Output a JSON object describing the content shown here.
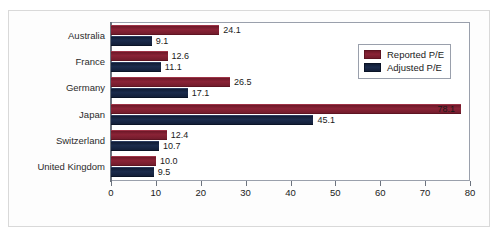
{
  "chart_data": {
    "type": "bar",
    "orientation": "horizontal",
    "title": "",
    "xlabel": "",
    "ylabel": "",
    "xlim": [
      0,
      80
    ],
    "xticks": [
      0,
      10,
      20,
      30,
      40,
      50,
      60,
      70,
      80
    ],
    "grid": false,
    "legend_position": "top-right",
    "categories": [
      "Australia",
      "France",
      "Germany",
      "Japan",
      "Switzerland",
      "United Kingdom"
    ],
    "series": [
      {
        "name": "Reported P/E",
        "color": "#7b1c2c",
        "values": [
          24.1,
          12.6,
          26.5,
          78.1,
          12.4,
          10.0
        ],
        "labels": [
          "24.1",
          "12.6",
          "26.5",
          "78.1",
          "12.4",
          "10.0"
        ]
      },
      {
        "name": "Adjusted P/E",
        "color": "#14233f",
        "values": [
          9.1,
          11.1,
          17.1,
          45.1,
          10.7,
          9.5
        ],
        "labels": [
          "9.1",
          "11.1",
          "17.1",
          "45.1",
          "10.7",
          "9.5"
        ]
      }
    ]
  },
  "legend": {
    "items": [
      {
        "label": "Reported P/E",
        "swatch": "reported"
      },
      {
        "label": "Adjusted P/E",
        "swatch": "adjusted"
      }
    ]
  }
}
